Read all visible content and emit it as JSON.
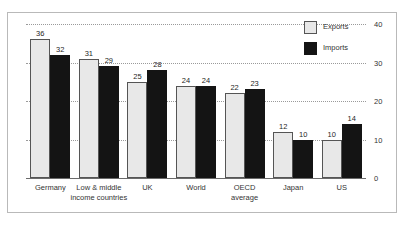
{
  "chart_data": {
    "type": "bar",
    "title": "",
    "subtitle": "",
    "xlabel": "",
    "ylabel": "",
    "ylim": [
      0,
      40
    ],
    "yticks": [
      0,
      10,
      20,
      30,
      40
    ],
    "grid": true,
    "legend_position": "top-right",
    "categories": [
      "Germany",
      "Low & middle income countries",
      "UK",
      "World",
      "OECD average",
      "Japan",
      "US"
    ],
    "category_lines": [
      [
        "Germany"
      ],
      [
        "Low & middle",
        "income countries"
      ],
      [
        "UK"
      ],
      [
        "World"
      ],
      [
        "OECD",
        "average"
      ],
      [
        "Japan"
      ],
      [
        "US"
      ]
    ],
    "series": [
      {
        "name": "Exports",
        "color": "#e8e8e8",
        "values": [
          36,
          31,
          25,
          24,
          22,
          12,
          10
        ]
      },
      {
        "name": "Imports",
        "color": "#141414",
        "values": [
          32,
          29,
          28,
          24,
          23,
          10,
          14
        ]
      }
    ]
  },
  "legend": {
    "items": [
      {
        "label": "Exports",
        "swatch": "exports"
      },
      {
        "label": "Imports",
        "swatch": "imports"
      }
    ]
  }
}
